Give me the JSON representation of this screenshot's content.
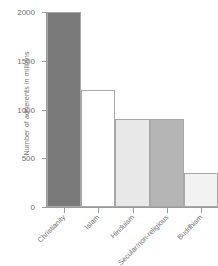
{
  "chart_data": {
    "type": "bar",
    "title": "",
    "subtitle": "",
    "xlabel": "",
    "ylabel": "Number of adherents in millions",
    "categories": [
      "Christianity",
      "Islam",
      "Hinduism",
      "Secular/non-religious",
      "Buddhism"
    ],
    "values": [
      2000,
      1200,
      900,
      900,
      350
    ],
    "bar_colors": [
      "#7a7a7a",
      "#ffffff",
      "#e8e8e8",
      "#b5b5b5",
      "#f2f2f2"
    ],
    "bar_outline_color": "#a8a8a8",
    "ylim": [
      0,
      2000
    ],
    "ytick_values": [
      0,
      500,
      1000,
      1500,
      2000
    ],
    "ytick_labels": [
      "0",
      "500",
      "1000",
      "1500",
      "2000"
    ],
    "grid": false,
    "legend": "none",
    "axis_color": "#9a9a9a",
    "text_color": "#6f6f6f",
    "background": "#ffffff",
    "xtick_label_rotation": -45
  }
}
